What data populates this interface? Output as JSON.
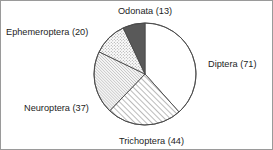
{
  "chart_data": {
    "type": "pie",
    "title": "",
    "subtitle": "",
    "xlabel": "",
    "ylabel": "",
    "total": 185,
    "legend_position": "outside-labels",
    "grid": false,
    "start_angle_deg": 0,
    "direction": "clockwise",
    "categories": [
      "Diptera",
      "Trichoptera",
      "Neuroptera",
      "Ephemeroptera",
      "Odonata"
    ],
    "values": [
      71,
      44,
      37,
      20,
      13
    ],
    "labels": [
      "Diptera (71)",
      "Trichoptera (44)",
      "Neuroptera (37)",
      "Ephemeroptera (20)",
      "Odonata (13)"
    ],
    "slices": [
      {
        "name": "Diptera",
        "value": 71,
        "label": "Diptera (71)",
        "fill": "solid-white",
        "color": "#ffffff",
        "start_deg": 0,
        "end_deg": 138.16
      },
      {
        "name": "Trichoptera",
        "value": 44,
        "label": "Trichoptera (44)",
        "fill": "diagonal-hatch-coarse",
        "color": "#ffffff",
        "start_deg": 138.16,
        "end_deg": 223.78
      },
      {
        "name": "Neuroptera",
        "value": 37,
        "label": "Neuroptera (37)",
        "fill": "diagonal-hatch-fine",
        "color": "#f0f0f0",
        "start_deg": 223.78,
        "end_deg": 295.78
      },
      {
        "name": "Ephemeroptera",
        "value": 20,
        "label": "Ephemeroptera (20)",
        "fill": "dotted-stipple",
        "color": "#fafafa",
        "start_deg": 295.78,
        "end_deg": 334.7
      },
      {
        "name": "Odonata",
        "value": 13,
        "label": "Odonata (13)",
        "fill": "solid-gray",
        "color": "#595959",
        "start_deg": 334.7,
        "end_deg": 360.0
      }
    ],
    "geometry": {
      "center_x": 144,
      "center_y": 73,
      "radius": 51
    },
    "colors": {
      "outline": "#4a4a4a",
      "text": "#1d1d1d",
      "frame": "#9a9a9a",
      "background": "#ffffff"
    }
  }
}
